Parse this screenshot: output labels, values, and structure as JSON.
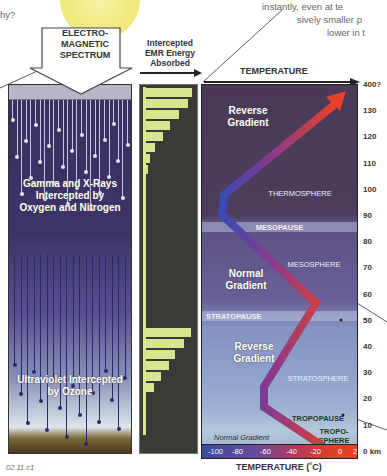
{
  "corner_text": {
    "left_fragment": "hy?",
    "right_lines": [
      "instantly, even at te",
      "sively smaller p",
      "lower in t"
    ]
  },
  "spectrum_panel": {
    "title": "ELECTRO-\nMAGNETIC\nSPECTRUM",
    "title_lines": [
      "ELECTRO-",
      "MAGNETIC",
      "SPECTRUM"
    ],
    "gamma_label_lines": [
      "Gamma and X-Rays",
      "Intercepted by",
      "Oxygen and Nitrogen"
    ],
    "uv_label_lines": [
      "Ultraviolet Intercepted",
      "by Ozone"
    ]
  },
  "energy_panel": {
    "title_lines": [
      "Intercepted",
      "EMR Energy",
      "Absorbed"
    ]
  },
  "temperature_panel": {
    "title": "TEMPERATURE",
    "xlabel": "TEMPERATURE (˚C)",
    "layers": {
      "thermosphere": "THERMOSPHERE",
      "mesopause": "MESOPAUSE",
      "mesosphere": "MESOSPHERE",
      "stratopause": "STRATOPAUSE",
      "stratosphere": "STRATOSPHERE",
      "tropopause": "TROPOPAUSE",
      "troposphere_lines": [
        "TROPO-",
        "SPHERE"
      ]
    },
    "gradients": {
      "top": [
        "Reverse",
        "Gradient"
      ],
      "middle": [
        "Normal",
        "Gradient"
      ],
      "lower": [
        "Reverse",
        "Gradient"
      ],
      "bottom": "Normal Gradient"
    },
    "scale_ticks": [
      "-100",
      "-80",
      "-60",
      "-40",
      "-20",
      "0",
      "2"
    ],
    "altitude_ticks": [
      "400?",
      "130",
      "120",
      "110",
      "100",
      "90",
      "80",
      "70",
      "60",
      "50",
      "40",
      "30",
      "20",
      "10",
      "0 km"
    ]
  },
  "figure_id": "02.11.c1",
  "colors": {
    "bar": "#d9e48f",
    "bar_bg": "#3c3a37",
    "thermo_bg": "#4a3a58",
    "curve_cold": "#3a4ab0",
    "curve_hot": "#e03a2a"
  },
  "chart_data": [
    {
      "type": "bar",
      "title": "Intercepted EMR Energy Absorbed",
      "orientation": "horizontal",
      "upper_group_relative_lengths": [
        1.0,
        0.92,
        0.72,
        0.53,
        0.38,
        0.2,
        0.08,
        0.05
      ],
      "lower_group_relative_lengths": [
        0.98,
        0.83,
        0.64,
        0.49,
        0.32,
        0.18
      ]
    },
    {
      "type": "line",
      "title": "TEMPERATURE",
      "xlabel": "TEMPERATURE (˚C)",
      "ylabel": "Altitude (km)",
      "x_ticks": [
        -100,
        -80,
        -60,
        -40,
        -20,
        0
      ],
      "y_ticks": [
        0,
        10,
        20,
        30,
        40,
        50,
        60,
        70,
        80,
        90,
        100,
        110,
        120,
        130
      ],
      "y_top_label": "400?",
      "series": [
        {
          "name": "Temperature profile",
          "points": [
            [
              -20,
              0
            ],
            [
              -57,
              12
            ],
            [
              -57,
              20
            ],
            [
              -20,
              50
            ],
            [
              -90,
              85
            ],
            [
              -90,
              100
            ],
            [
              50,
              140
            ]
          ]
        }
      ],
      "layers": [
        {
          "name": "TROPOSPHERE",
          "range_km": [
            0,
            12
          ]
        },
        {
          "name": "TROPOPAUSE",
          "alt_km": 12
        },
        {
          "name": "STRATOSPHERE",
          "range_km": [
            12,
            50
          ]
        },
        {
          "name": "STRATOPAUSE",
          "alt_km": 50
        },
        {
          "name": "MESOSPHERE",
          "range_km": [
            50,
            85
          ]
        },
        {
          "name": "MESOPAUSE",
          "alt_km": 85
        },
        {
          "name": "THERMOSPHERE",
          "range_km": [
            85,
            400
          ]
        }
      ]
    }
  ]
}
